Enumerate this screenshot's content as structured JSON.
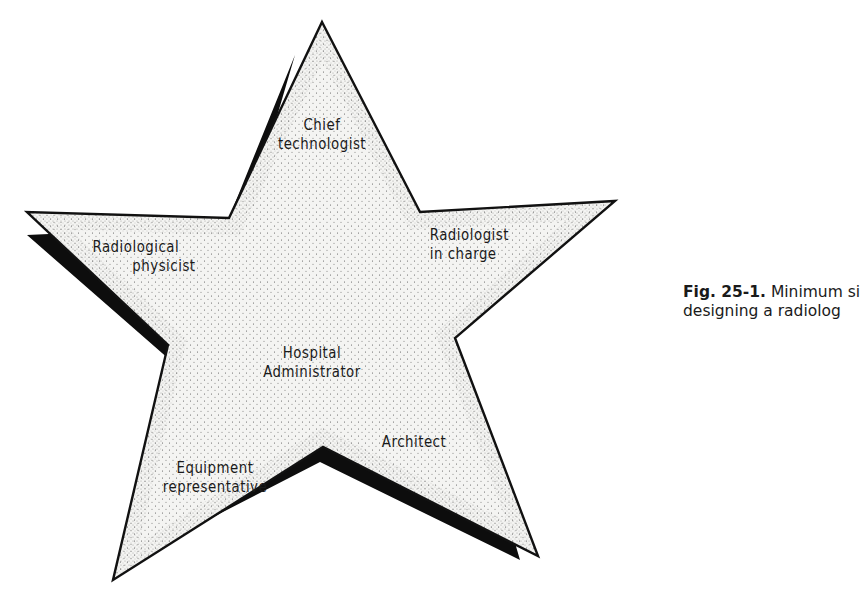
{
  "diagram": {
    "shape": "five-pointed star with drop shadow",
    "center_label": {
      "line1": "Hospital",
      "line2": "Administrator"
    },
    "points": [
      {
        "position": "top",
        "line1": "Chief",
        "line2": "technologist"
      },
      {
        "position": "right",
        "line1": "Radiologist",
        "line2": "in charge"
      },
      {
        "position": "bottom-right",
        "line1": "Architect",
        "line2": ""
      },
      {
        "position": "bottom-left",
        "line1": "Equipment",
        "line2": "representative"
      },
      {
        "position": "left",
        "line1": "Radiological",
        "line2": "physicist"
      }
    ]
  },
  "caption": {
    "figure_number": "Fig. 25-1.",
    "line1_text": "Minimum si",
    "line2_text": "designing a radiolog"
  },
  "colors": {
    "outline": "#111111",
    "shadow": "#0d0d0d",
    "fill": "#f4f4f2",
    "stipple": "#555555",
    "text": "#1a1a1a"
  }
}
